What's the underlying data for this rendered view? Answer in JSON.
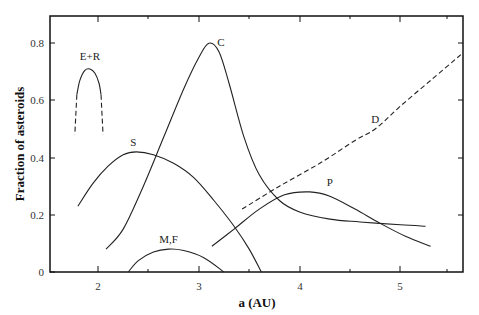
{
  "chart_data": {
    "type": "line",
    "title": "",
    "xlabel": "a (AU)",
    "ylabel": "Fraction of asteroids",
    "xlim": [
      1.52,
      5.62
    ],
    "ylim": [
      0,
      0.895
    ],
    "x_ticks": [
      2,
      3,
      4,
      5
    ],
    "x_tick_labels": [
      "2",
      "3",
      "4",
      "5"
    ],
    "x_minor_ticks": [
      2.5,
      3.5,
      4.5,
      5.5
    ],
    "y_ticks": [
      0,
      0.2,
      0.4,
      0.6,
      0.8
    ],
    "y_tick_labels": [
      "0",
      "0.2",
      "0.4",
      "0.6",
      "0.8"
    ],
    "grid": false,
    "legend": "none (curves labeled inline)",
    "series": [
      {
        "name": "E+R",
        "style": "solid",
        "points": [
          [
            1.79,
            0.62
          ],
          [
            1.82,
            0.67
          ],
          [
            1.87,
            0.705
          ],
          [
            1.92,
            0.71
          ],
          [
            1.97,
            0.695
          ],
          [
            2.01,
            0.66
          ],
          [
            2.03,
            0.62
          ]
        ]
      },
      {
        "name": "E+R (dashed extension)",
        "style": "dashed",
        "points_left": [
          [
            1.79,
            0.62
          ],
          [
            1.77,
            0.48
          ]
        ],
        "points_right": [
          [
            2.03,
            0.62
          ],
          [
            2.05,
            0.48
          ]
        ]
      },
      {
        "name": "S",
        "style": "solid",
        "points": [
          [
            1.8,
            0.23
          ],
          [
            1.95,
            0.31
          ],
          [
            2.1,
            0.37
          ],
          [
            2.25,
            0.41
          ],
          [
            2.38,
            0.42
          ],
          [
            2.55,
            0.41
          ],
          [
            2.75,
            0.38
          ],
          [
            2.95,
            0.33
          ],
          [
            3.15,
            0.25
          ],
          [
            3.35,
            0.16
          ],
          [
            3.5,
            0.08
          ],
          [
            3.62,
            0.0
          ]
        ]
      },
      {
        "name": "C",
        "style": "solid",
        "points": [
          [
            2.08,
            0.08
          ],
          [
            2.25,
            0.15
          ],
          [
            2.45,
            0.3
          ],
          [
            2.65,
            0.47
          ],
          [
            2.85,
            0.64
          ],
          [
            3.0,
            0.75
          ],
          [
            3.1,
            0.8
          ],
          [
            3.2,
            0.77
          ],
          [
            3.3,
            0.66
          ],
          [
            3.45,
            0.47
          ],
          [
            3.6,
            0.34
          ],
          [
            3.8,
            0.25
          ],
          [
            4.0,
            0.21
          ],
          [
            4.3,
            0.185
          ],
          [
            4.6,
            0.175
          ],
          [
            5.0,
            0.165
          ],
          [
            5.25,
            0.16
          ]
        ]
      },
      {
        "name": "M,F",
        "style": "solid",
        "points": [
          [
            2.3,
            0.0
          ],
          [
            2.4,
            0.04
          ],
          [
            2.55,
            0.07
          ],
          [
            2.7,
            0.08
          ],
          [
            2.85,
            0.075
          ],
          [
            3.05,
            0.05
          ],
          [
            3.25,
            0.0
          ]
        ]
      },
      {
        "name": "P",
        "style": "solid",
        "points": [
          [
            3.13,
            0.09
          ],
          [
            3.35,
            0.15
          ],
          [
            3.6,
            0.22
          ],
          [
            3.85,
            0.27
          ],
          [
            4.1,
            0.28
          ],
          [
            4.3,
            0.265
          ],
          [
            4.55,
            0.22
          ],
          [
            4.8,
            0.17
          ],
          [
            5.05,
            0.125
          ],
          [
            5.3,
            0.09
          ]
        ]
      },
      {
        "name": "D",
        "style": "dashed",
        "points": [
          [
            3.43,
            0.22
          ],
          [
            3.8,
            0.3
          ],
          [
            4.2,
            0.38
          ],
          [
            4.55,
            0.46
          ],
          [
            4.75,
            0.5
          ],
          [
            5.0,
            0.58
          ],
          [
            5.3,
            0.67
          ],
          [
            5.6,
            0.76
          ]
        ]
      }
    ],
    "annotations": [
      {
        "text": "E+R",
        "x": 1.92,
        "y": 0.74
      },
      {
        "text": "S",
        "x": 2.35,
        "y": 0.44
      },
      {
        "text": "C",
        "x": 3.22,
        "y": 0.79
      },
      {
        "text": "M,F",
        "x": 2.7,
        "y": 0.1
      },
      {
        "text": "P",
        "x": 4.3,
        "y": 0.3
      },
      {
        "text": "D",
        "x": 4.75,
        "y": 0.52
      }
    ]
  },
  "labels": {
    "xlabel": "a (AU)",
    "ylabel": "Fraction of asteroids",
    "x_ticks": [
      "2",
      "3",
      "4",
      "5"
    ],
    "y_ticks": [
      "0",
      "0.2",
      "0.4",
      "0.6",
      "0.8"
    ],
    "curves": {
      "er": "E+R",
      "s": "S",
      "c": "C",
      "mf": "M,F",
      "p": "P",
      "d": "D"
    }
  }
}
